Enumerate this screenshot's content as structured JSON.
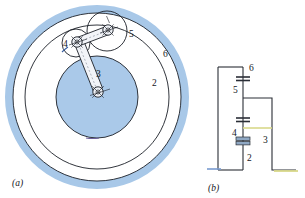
{
  "figure": {
    "panels": [
      {
        "id": "panel-a",
        "caption": "(a)",
        "description": "epicyclic-mechanism-schematic",
        "labels": [
          {
            "key": "link2",
            "text": "2",
            "x": 152,
            "y": 86
          },
          {
            "key": "link3",
            "text": "3",
            "x": 96,
            "y": 77
          },
          {
            "key": "link4",
            "text": "4",
            "x": 63,
            "y": 47
          },
          {
            "key": "link5",
            "text": "5",
            "x": 129,
            "y": 37
          },
          {
            "key": "link6",
            "text": "6",
            "x": 163,
            "y": 57
          }
        ],
        "colors": {
          "ring_band": "#a8c8e8",
          "inner_disk": "#aac9e9",
          "outline": "#1b1f27",
          "link_fill": "#f2f4f8"
        },
        "geometry": {
          "center_x": 97,
          "center_y": 97,
          "outer_ring_outer_r": 92,
          "outer_ring_inner_r": 84,
          "mid_circle_r": 72,
          "inner_disk_r": 41
        }
      },
      {
        "id": "panel-b",
        "caption": "(b)",
        "description": "kinematic-structure-graph",
        "labels": [
          {
            "key": "node6",
            "text": "6",
            "x": 249,
            "y": 71
          },
          {
            "key": "node5",
            "text": "5",
            "x": 233,
            "y": 89
          },
          {
            "key": "node4",
            "text": "4",
            "x": 233,
            "y": 135
          },
          {
            "key": "node3",
            "text": "3",
            "x": 263,
            "y": 140
          },
          {
            "key": "node2",
            "text": "2",
            "x": 240,
            "y": 163
          }
        ],
        "colors": {
          "line": "#2a2e36",
          "joint_fill": "#8fa8c4",
          "ground_accent": "#d9d98a",
          "ground_accent_left": "#7a9bd0"
        }
      }
    ]
  }
}
